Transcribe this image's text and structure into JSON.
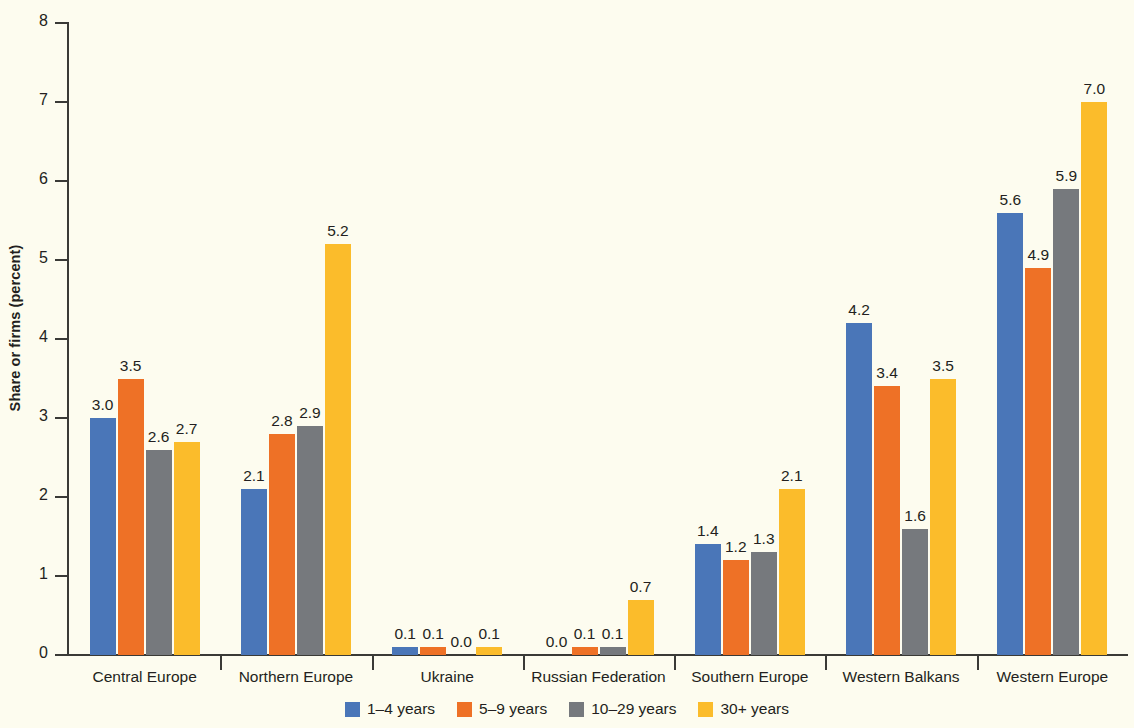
{
  "chart_data": {
    "type": "bar",
    "title": "",
    "subtitle": "",
    "xlabel": "",
    "ylabel": "Share or firms (percent)",
    "ylim": [
      0,
      8
    ],
    "yticks": [
      0,
      1,
      2,
      3,
      4,
      5,
      6,
      7,
      8
    ],
    "ytick_labels": [
      "0",
      "1",
      "2",
      "3",
      "4",
      "5",
      "6",
      "7",
      "8"
    ],
    "grid": false,
    "legend_position": "bottom-center",
    "value_label_format": "one-decimal",
    "categories": [
      "Central Europe",
      "Northern Europe",
      "Ukraine",
      "Russian Federation",
      "Southern Europe",
      "Western Balkans",
      "Western Europe"
    ],
    "series": [
      {
        "name": "1–4 years",
        "color": "#4a76b8",
        "values": [
          3.0,
          2.1,
          0.1,
          0.0,
          1.4,
          4.2,
          5.6
        ],
        "labels": [
          "3.0",
          "2.1",
          "0.1",
          "0.0",
          "1.4",
          "4.2",
          "5.6"
        ]
      },
      {
        "name": "5–9 years",
        "color": "#ee7126",
        "values": [
          3.5,
          2.8,
          0.1,
          0.1,
          1.2,
          3.4,
          4.9
        ],
        "labels": [
          "3.5",
          "2.8",
          "0.1",
          "0.1",
          "1.2",
          "3.4",
          "4.9"
        ]
      },
      {
        "name": "10–29 years",
        "color": "#76797d",
        "values": [
          2.6,
          2.9,
          0.0,
          0.1,
          1.3,
          1.6,
          5.9
        ],
        "labels": [
          "2.6",
          "2.9",
          "0.0",
          "0.1",
          "1.3",
          "1.6",
          "5.9"
        ]
      },
      {
        "name": "30+ years",
        "color": "#fbbc2b",
        "values": [
          2.7,
          5.2,
          0.1,
          0.7,
          2.1,
          3.5,
          7.0
        ],
        "labels": [
          "2.7",
          "5.2",
          "0.1",
          "0.7",
          "2.1",
          "3.5",
          "7.0"
        ]
      }
    ]
  },
  "colors": {
    "background": "#fdfcef",
    "axis": "#3a3a36",
    "text": "#231f20"
  }
}
